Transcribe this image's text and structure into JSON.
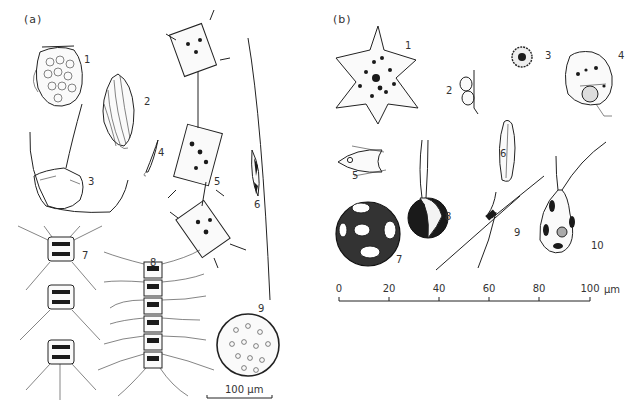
{
  "figure": {
    "panel_a": {
      "label": "(a)",
      "specimens": [
        {
          "id": "1",
          "label": "1"
        },
        {
          "id": "2",
          "label": "2"
        },
        {
          "id": "3",
          "label": "3"
        },
        {
          "id": "4",
          "label": "4"
        },
        {
          "id": "5",
          "label": "5"
        },
        {
          "id": "6",
          "label": "6"
        },
        {
          "id": "7",
          "label": "7"
        },
        {
          "id": "8",
          "label": "8"
        },
        {
          "id": "9",
          "label": "9"
        }
      ],
      "scale_bar": {
        "label": "100 µm"
      }
    },
    "panel_b": {
      "label": "(b)",
      "specimens": [
        {
          "id": "1",
          "label": "1"
        },
        {
          "id": "2",
          "label": "2"
        },
        {
          "id": "3",
          "label": "3"
        },
        {
          "id": "4",
          "label": "4"
        },
        {
          "id": "5",
          "label": "5"
        },
        {
          "id": "6",
          "label": "6"
        },
        {
          "id": "7",
          "label": "7"
        },
        {
          "id": "8",
          "label": "8"
        },
        {
          "id": "9",
          "label": "9"
        },
        {
          "id": "10",
          "label": "10"
        }
      ],
      "scale_bar": {
        "ticks": [
          "0",
          "20",
          "40",
          "60",
          "80",
          "100"
        ],
        "unit": "µm"
      }
    }
  }
}
